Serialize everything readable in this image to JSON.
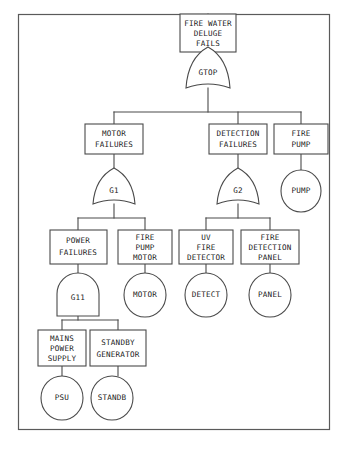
{
  "diagram": {
    "type": "fault-tree",
    "title_text": "",
    "frame": {
      "x": 18,
      "y": 14,
      "width": 312,
      "height": 416
    },
    "colors": {
      "background": "#ffffff",
      "stroke": "#4a4a4a",
      "frame_stroke": "#5a5a5a",
      "text": "#1a1a1a"
    },
    "nodes": {
      "top_event": {
        "id": "top-event",
        "kind": "box",
        "lines": [
          "FIRE WATER",
          "DELUGE",
          "FAILS"
        ],
        "x": 180,
        "y": 14,
        "width": 56,
        "height": 38
      },
      "gate_top": {
        "id": "gate-gtop",
        "kind": "or-gate",
        "label": "GTOP",
        "cx": 208,
        "cy": 69,
        "width": 44,
        "height": 44
      },
      "motor_failures": {
        "id": "motor-failures",
        "kind": "box",
        "lines": [
          "MOTOR",
          "FAILURES"
        ],
        "x": 85,
        "y": 124,
        "width": 58,
        "height": 30
      },
      "detection_failures": {
        "id": "detection-failures",
        "kind": "box",
        "lines": [
          "DETECTION",
          "FAILURES"
        ],
        "x": 209,
        "y": 124,
        "width": 58,
        "height": 30
      },
      "fire_pump": {
        "id": "fire-pump",
        "kind": "box",
        "lines": [
          "FIRE",
          "PUMP"
        ],
        "x": 274,
        "y": 124,
        "width": 54,
        "height": 30
      },
      "gate_g1": {
        "id": "gate-g1",
        "kind": "or-gate",
        "label": "G1",
        "cx": 114,
        "cy": 188,
        "width": 44,
        "height": 40
      },
      "gate_g2": {
        "id": "gate-g2",
        "kind": "or-gate",
        "label": "G2",
        "cx": 238,
        "cy": 188,
        "width": 44,
        "height": 40
      },
      "event_pump": {
        "id": "event-pump",
        "kind": "circle",
        "label": "PUMP",
        "cx": 301,
        "cy": 191,
        "rx": 20,
        "ry": 21
      },
      "power_failures": {
        "id": "power-failures",
        "kind": "box",
        "lines": [
          "POWER",
          "FAILURES"
        ],
        "x": 50,
        "y": 230,
        "width": 57,
        "height": 34
      },
      "fire_pump_motor": {
        "id": "fire-pump-motor",
        "kind": "box",
        "lines": [
          "FIRE",
          "PUMP",
          "MOTOR"
        ],
        "x": 118,
        "y": 230,
        "width": 54,
        "height": 34
      },
      "uv_fire_detector": {
        "id": "uv-fire-detector",
        "kind": "box",
        "lines": [
          "UV",
          "FIRE",
          "DETECTOR"
        ],
        "x": 179,
        "y": 230,
        "width": 54,
        "height": 34
      },
      "fire_detection_panel": {
        "id": "fire-detection-panel",
        "kind": "box",
        "lines": [
          "FIRE",
          "DETECTION",
          "PANEL"
        ],
        "x": 241,
        "y": 230,
        "width": 58,
        "height": 34
      },
      "gate_g11": {
        "id": "gate-g11",
        "kind": "and-gate",
        "label": "G11",
        "cx": 78,
        "cy": 296,
        "width": 42,
        "height": 40
      },
      "event_motor": {
        "id": "event-motor",
        "kind": "circle",
        "label": "MOTOR",
        "cx": 145,
        "cy": 295,
        "rx": 21,
        "ry": 22
      },
      "event_detect": {
        "id": "event-detect",
        "kind": "circle",
        "label": "DETECT",
        "cx": 206,
        "cy": 295,
        "rx": 21,
        "ry": 22
      },
      "event_panel": {
        "id": "event-panel",
        "kind": "circle",
        "label": "PANEL",
        "cx": 270,
        "cy": 295,
        "rx": 21,
        "ry": 22
      },
      "mains_power_supply": {
        "id": "mains-power-supply",
        "kind": "box",
        "lines": [
          "MAINS",
          "POWER",
          "SUPPLY"
        ],
        "x": 38,
        "y": 330,
        "width": 48,
        "height": 36
      },
      "standby_generator": {
        "id": "standby-generator",
        "kind": "box",
        "lines": [
          "STANDBY",
          "GENERATOR"
        ],
        "x": 90,
        "y": 330,
        "width": 56,
        "height": 36
      },
      "event_psu": {
        "id": "event-psu",
        "kind": "circle",
        "label": "PSU",
        "cx": 62,
        "cy": 398,
        "rx": 21,
        "ry": 22
      },
      "event_standb": {
        "id": "event-standb",
        "kind": "circle",
        "label": "STANDB",
        "cx": 112,
        "cy": 398,
        "rx": 21,
        "ry": 22
      }
    },
    "edges": [
      {
        "from": "frame-top",
        "to": "top-event"
      },
      {
        "from": "top-event",
        "to": "gate-gtop"
      },
      {
        "from": "gate-gtop",
        "to": "motor-failures"
      },
      {
        "from": "gate-gtop",
        "to": "detection-failures"
      },
      {
        "from": "gate-gtop",
        "to": "fire-pump"
      },
      {
        "from": "motor-failures",
        "to": "gate-g1"
      },
      {
        "from": "detection-failures",
        "to": "gate-g2"
      },
      {
        "from": "fire-pump",
        "to": "event-pump"
      },
      {
        "from": "gate-g1",
        "to": "power-failures"
      },
      {
        "from": "gate-g1",
        "to": "fire-pump-motor"
      },
      {
        "from": "gate-g2",
        "to": "uv-fire-detector"
      },
      {
        "from": "gate-g2",
        "to": "fire-detection-panel"
      },
      {
        "from": "power-failures",
        "to": "gate-g11"
      },
      {
        "from": "fire-pump-motor",
        "to": "event-motor"
      },
      {
        "from": "uv-fire-detector",
        "to": "event-detect"
      },
      {
        "from": "fire-detection-panel",
        "to": "event-panel"
      },
      {
        "from": "gate-g11",
        "to": "mains-power-supply"
      },
      {
        "from": "gate-g11",
        "to": "standby-generator"
      },
      {
        "from": "mains-power-supply",
        "to": "event-psu"
      },
      {
        "from": "standby-generator",
        "to": "event-standb"
      }
    ]
  }
}
